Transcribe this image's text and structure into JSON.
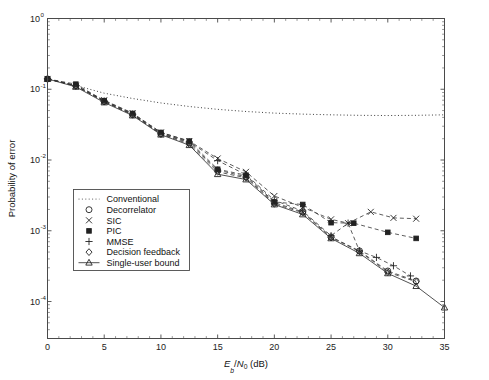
{
  "chart_data": {
    "type": "line",
    "title": "",
    "xlabel": "E_b/N_0 (dB)",
    "xlabel_parts": {
      "e": "E",
      "b": "b",
      "slash": "/",
      "n": "N",
      "zero": "0",
      "unit": "(dB)"
    },
    "ylabel": "Probability of error",
    "xlim": [
      0,
      35
    ],
    "ylim": [
      3e-05,
      1.0
    ],
    "yscale": "log",
    "xscale": "linear",
    "xticks": [
      0,
      5,
      10,
      15,
      20,
      25,
      30,
      35
    ],
    "xticklabels": [
      "0",
      "5",
      "10",
      "15",
      "20",
      "25",
      "30",
      "35"
    ],
    "yticks": [
      1,
      0.1,
      0.01,
      0.001,
      0.0001
    ],
    "yticklabels": [
      "10^0",
      "10^-1",
      "10^-2",
      "10^-3",
      "10^-4"
    ],
    "ytick_mant": [
      "10",
      "10",
      "10",
      "10",
      "10"
    ],
    "ytick_exp": [
      "0",
      "-1",
      "-2",
      "-3",
      "-4"
    ],
    "grid": false,
    "legend_position": "center-left",
    "series": [
      {
        "name": "Conventional",
        "marker": "none",
        "linestyle": "dotted",
        "x": [
          0,
          2.5,
          5,
          7.5,
          10,
          12.5,
          15,
          17.5,
          20,
          22.5,
          25,
          27.5,
          30,
          32.5,
          35
        ],
        "y": [
          0.14,
          0.113,
          0.088,
          0.074,
          0.064,
          0.057,
          0.052,
          0.0485,
          0.046,
          0.0445,
          0.0435,
          0.0428,
          0.0425,
          0.0428,
          0.0435
        ]
      },
      {
        "name": "Decorrelator",
        "marker": "circle",
        "linestyle": "dashed",
        "x": [
          0,
          2.5,
          5,
          7.5,
          10,
          12.5,
          15,
          17.5,
          20,
          22.5,
          25,
          27.5,
          30,
          32.5
        ],
        "y": [
          0.14,
          0.112,
          0.067,
          0.044,
          0.0235,
          0.0175,
          0.0072,
          0.0058,
          0.0025,
          0.00185,
          0.00082,
          0.00052,
          0.00027,
          0.000195
        ]
      },
      {
        "name": "SIC",
        "marker": "x",
        "linestyle": "dashed",
        "x": [
          0,
          2.5,
          5,
          7.5,
          10,
          12.5,
          15,
          17.5,
          20,
          22.5,
          25,
          26.5,
          28.5,
          30.5,
          32.5
        ],
        "y": [
          0.14,
          0.112,
          0.07,
          0.046,
          0.0245,
          0.0185,
          0.0105,
          0.0068,
          0.0031,
          0.00215,
          0.00145,
          0.00128,
          0.00185,
          0.00152,
          0.00148
        ]
      },
      {
        "name": "PIC",
        "marker": "square-filled",
        "linestyle": "dashed",
        "x": [
          0,
          2.5,
          5,
          7.5,
          10,
          12.5,
          15,
          17.5,
          20,
          22.5,
          25,
          27,
          30,
          32.5
        ],
        "y": [
          0.14,
          0.118,
          0.069,
          0.0455,
          0.0245,
          0.0185,
          0.0074,
          0.0061,
          0.00255,
          0.00235,
          0.0013,
          0.00128,
          0.00095,
          0.00078
        ]
      },
      {
        "name": "MMSE",
        "marker": "plus",
        "linestyle": "dashed",
        "x": [
          0,
          2.5,
          5,
          7.5,
          10,
          12.5,
          15,
          17.5,
          20,
          22.5,
          25,
          26.5,
          27.5,
          29,
          30.5,
          32
        ],
        "y": [
          0.14,
          0.112,
          0.068,
          0.0445,
          0.0238,
          0.018,
          0.0098,
          0.0062,
          0.0027,
          0.0019,
          0.00085,
          0.00128,
          0.00052,
          0.00042,
          0.00032,
          0.00023
        ]
      },
      {
        "name": "Decision feedback",
        "marker": "diamond",
        "linestyle": "dashed",
        "x": [
          0,
          2.5,
          5,
          7.5,
          10,
          12.5,
          15,
          17.5,
          20,
          22.5,
          25,
          27.5,
          30,
          32.5
        ],
        "y": [
          0.14,
          0.112,
          0.067,
          0.0435,
          0.0232,
          0.0168,
          0.0068,
          0.0056,
          0.0024,
          0.0018,
          0.0008,
          0.00051,
          0.00026,
          0.00019
        ]
      },
      {
        "name": "Single-user bound",
        "marker": "triangle",
        "linestyle": "solid",
        "x": [
          0,
          2.5,
          5,
          7.5,
          10,
          12.5,
          15,
          17.5,
          20,
          22.5,
          25,
          27.5,
          30,
          32.5,
          35
        ],
        "y": [
          0.14,
          0.108,
          0.065,
          0.0425,
          0.0228,
          0.0162,
          0.0063,
          0.0053,
          0.00235,
          0.0017,
          0.00078,
          0.00048,
          0.00025,
          0.000165,
          8.2e-05
        ]
      }
    ]
  },
  "legend": {
    "entries": [
      {
        "label": "Conventional",
        "marker": "none",
        "linestyle": "dotted"
      },
      {
        "label": "Decorrelator",
        "marker": "circle",
        "linestyle": "none"
      },
      {
        "label": "SIC",
        "marker": "x",
        "linestyle": "none"
      },
      {
        "label": "PIC",
        "marker": "square-filled",
        "linestyle": "none"
      },
      {
        "label": "MMSE",
        "marker": "plus",
        "linestyle": "none"
      },
      {
        "label": "Decision feedback",
        "marker": "diamond",
        "linestyle": "none"
      },
      {
        "label": "Single-user bound",
        "marker": "triangle",
        "linestyle": "solid"
      }
    ]
  },
  "colors": {
    "axis": "#4a4a4a",
    "text": "#111111",
    "line": "#333333",
    "background": "#ffffff"
  }
}
